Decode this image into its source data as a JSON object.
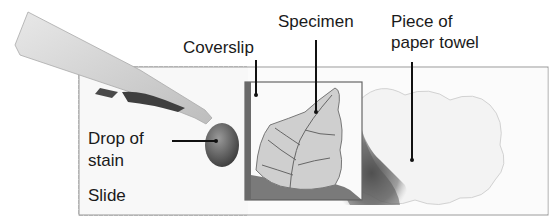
{
  "diagram": {
    "labels": {
      "coverslip": "Coverslip",
      "specimen": "Specimen",
      "paper_towel_line1": "Piece of",
      "paper_towel_line2": "paper towel",
      "drop_line1": "Drop of",
      "drop_line2": "stain",
      "slide": "Slide"
    }
  }
}
